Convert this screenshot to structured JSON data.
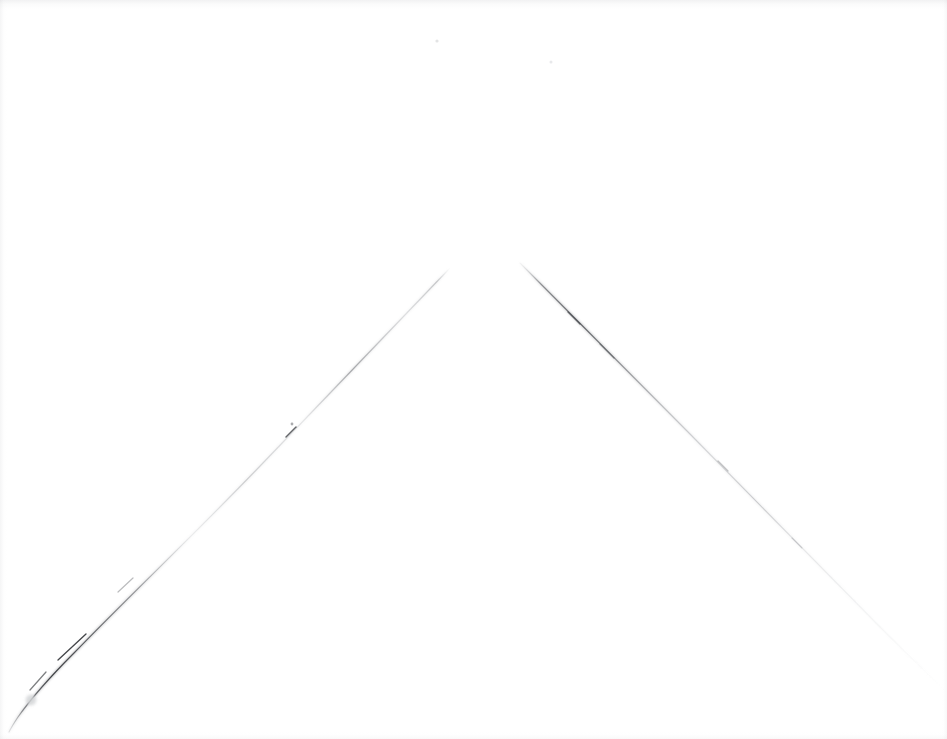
{
  "scene": {
    "kind": "scanned-blank-sheet",
    "width": 947,
    "height": 739,
    "background_color": "#ffffff",
    "paper_tint_color": "#fbfbfb",
    "description": "A nearly blank white scanned sheet bearing two faint hand-drawn graphite lines that meet in an inverted-V (chevron) near the top centre, with a small break at the apex."
  },
  "marks": {
    "ink_color": "#6e7074",
    "ink_color_dark": "#3a3c40",
    "ink_color_faint": "#c9cbce",
    "smudge_color": "#d7d8da",
    "items": [
      {
        "id": "left-stroke",
        "name": "left-diagonal-stroke",
        "label": "Left diagonal stroke",
        "start_x": 450,
        "start_y": 268,
        "end_x": 9,
        "end_y": 732,
        "darkest_x": 60,
        "darkest_y": 645,
        "note": "Runs from the apex down-left to the lower-left edge; fades almost to nothing in its upper half and curves slightly steeper near the bottom."
      },
      {
        "id": "right-stroke",
        "name": "right-diagonal-stroke",
        "label": "Right diagonal stroke",
        "start_x": 520,
        "start_y": 263,
        "end_x": 946,
        "end_y": 691,
        "darkest_x": 600,
        "darkest_y": 330,
        "note": "Runs from the apex down-right toward the lower-right corner; strongest in its upper third and fades out before reaching the corner."
      },
      {
        "id": "apex-gap",
        "name": "apex-gap",
        "label": "Gap at apex",
        "from_x": 450,
        "from_y": 268,
        "to_x": 520,
        "to_y": 263,
        "width_px": 70,
        "note": "The two strokes do not touch; a clean white gap separates their upper tips."
      },
      {
        "id": "smudge-dot",
        "name": "smudge-dot",
        "label": "Small grey smudge",
        "center_x": 31,
        "center_y": 700,
        "radius_px": 6
      },
      {
        "id": "speck-a",
        "name": "dust-speck",
        "label": "Dust speck",
        "center_x": 437,
        "center_y": 41,
        "radius_px": 2
      },
      {
        "id": "speck-b",
        "name": "dust-speck",
        "label": "Dust speck",
        "center_x": 551,
        "center_y": 62,
        "radius_px": 2
      },
      {
        "id": "speck-c",
        "name": "dust-speck",
        "label": "Dust speck",
        "center_x": 292,
        "center_y": 424,
        "radius_px": 2
      }
    ]
  },
  "caption": {
    "alt_text": "Blank white scanned page with two faint pencil lines forming an inverted V"
  }
}
